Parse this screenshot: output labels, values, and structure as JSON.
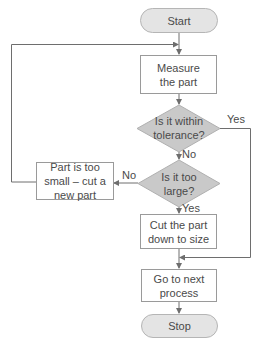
{
  "diagram": {
    "type": "flowchart",
    "colors": {
      "terminal_fill": "#e4e4e4",
      "decision_fill": "#c9c9c9",
      "process_fill": "#ffffff",
      "line": "#6e6e6e"
    },
    "nodes": {
      "start": "Start",
      "measure": "Measure the part",
      "decision_tolerance": "Is it within tolerance?",
      "decision_large": "Is it too large?",
      "too_small": "Part is too small – cut a new part",
      "cut": "Cut the part down to size",
      "next": "Go to next process",
      "stop": "Stop"
    },
    "edge_labels": {
      "tolerance_yes": "Yes",
      "tolerance_no": "No",
      "large_no": "No",
      "large_yes": "Yes"
    }
  }
}
